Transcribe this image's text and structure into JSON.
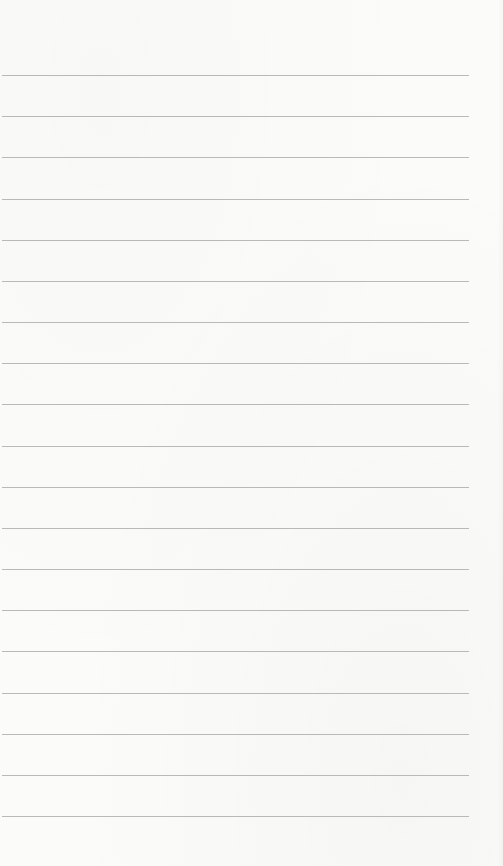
{
  "notepad": {
    "background_color": "#fbfbfa",
    "line_color": "#b9b9b9",
    "line_count": 19,
    "first_line_y": 75,
    "line_spacing": 41.17,
    "line_left": 2,
    "line_right": 469,
    "lines": [
      "",
      "",
      "",
      "",
      "",
      "",
      "",
      "",
      "",
      "",
      "",
      "",
      "",
      "",
      "",
      "",
      "",
      "",
      ""
    ]
  }
}
